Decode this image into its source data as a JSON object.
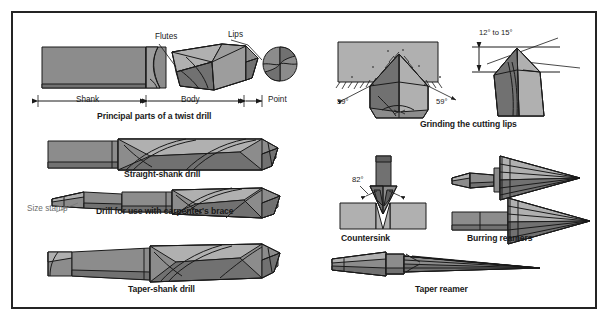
{
  "figure": {
    "width": 609,
    "height": 321,
    "background_color": "#ffffff",
    "frame_color": "#242424",
    "metal_fill": "#8c8c8c",
    "metal_fill_light": "#b5b5b5",
    "metal_fill_dark": "#6e6e6e",
    "outline_color": "#1a1a1a"
  },
  "panels": {
    "twist_drill_parts": {
      "caption": "Principal parts of a twist drill",
      "callouts": {
        "flutes": "Flutes",
        "lips": "Lips"
      },
      "dimensions": [
        {
          "label": "Shank"
        },
        {
          "label": "Body"
        },
        {
          "label": "Point"
        }
      ]
    },
    "straight_shank": {
      "caption": "Straight-shank drill"
    },
    "carpenters_brace": {
      "caption": "Drill for use with carpenter's brace",
      "callout": "Size stamp"
    },
    "taper_shank": {
      "caption": "Taper-shank drill"
    },
    "grinding": {
      "caption": "Grinding the cutting lips",
      "angles": [
        {
          "label": "59°"
        },
        {
          "label": "59°"
        },
        {
          "label": "12° to 15°"
        }
      ]
    },
    "countersink": {
      "caption": "Countersink",
      "angle": "82°"
    },
    "burring_reamers": {
      "caption": "Burring reamers"
    },
    "taper_reamer": {
      "caption": "Taper reamer"
    }
  }
}
